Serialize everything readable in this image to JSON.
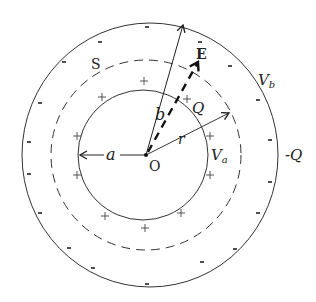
{
  "figure": {
    "labels": {
      "center": "O",
      "inner_radius": "a",
      "outer_radius": "b",
      "gauss_radius": "r",
      "field": "E",
      "surface": "S",
      "inner_potential": "V",
      "inner_potential_sub": "a",
      "outer_potential": "V",
      "outer_potential_sub": "b",
      "inner_charge": "Q",
      "outer_charge": "-Q"
    },
    "inner_charge_sign": "+",
    "outer_charge_sign": "-",
    "colors": {
      "line": "#333333",
      "text": "#222222",
      "background": "#ffffff"
    }
  }
}
